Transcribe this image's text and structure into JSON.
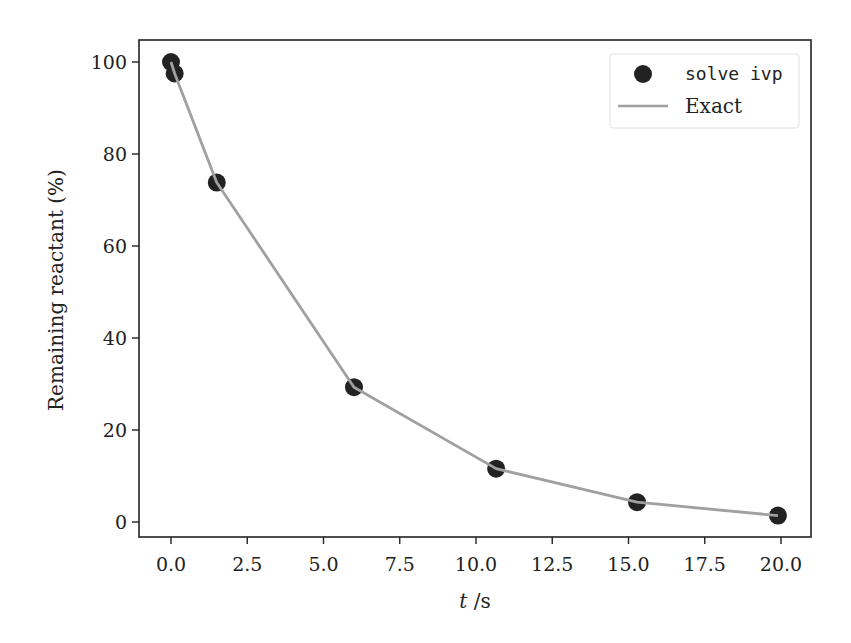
{
  "chart_data": {
    "type": "line",
    "title": "",
    "xlabel": "t /s",
    "ylabel": "Remaining reactant (%)",
    "xlim": [
      -0.9,
      20.9
    ],
    "ylim": [
      -3.5,
      104
    ],
    "xticks": [
      0.0,
      2.5,
      5.0,
      7.5,
      10.0,
      12.5,
      15.0,
      17.5,
      20.0
    ],
    "xtick_labels": [
      "0.0",
      "2.5",
      "5.0",
      "7.5",
      "10.0",
      "12.5",
      "15.0",
      "17.5",
      "20.0"
    ],
    "yticks": [
      0,
      20,
      40,
      60,
      80,
      100
    ],
    "ytick_labels": [
      "0",
      "20",
      "40",
      "60",
      "80",
      "100"
    ],
    "grid": false,
    "legend_position": "upper right",
    "series": [
      {
        "name": "solve ivp",
        "kind": "scatter",
        "color": "#222222",
        "x": [
          0.0,
          0.12,
          1.5,
          6.0,
          10.66,
          15.28,
          19.9
        ],
        "y": [
          100.0,
          97.5,
          73.8,
          29.3,
          11.6,
          4.3,
          1.4
        ]
      },
      {
        "name": "Exact",
        "kind": "line",
        "color": "#a0a0a0",
        "x": [
          0.0,
          0.12,
          1.5,
          6.0,
          10.66,
          15.28,
          19.9
        ],
        "y": [
          100.0,
          97.5,
          73.8,
          29.3,
          11.6,
          4.3,
          1.4
        ]
      }
    ]
  },
  "legend": {
    "items": [
      {
        "label": "solve ivp",
        "marker": "circle",
        "color": "#222222"
      },
      {
        "label": "Exact",
        "marker": "line",
        "color": "#a0a0a0"
      }
    ]
  },
  "axes": {
    "xlabel": "t /s",
    "xlabel_var": "t",
    "xlabel_unit": " /s",
    "ylabel": "Remaining reactant (%)"
  }
}
